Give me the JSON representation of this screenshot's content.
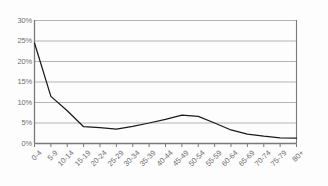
{
  "chart_data": {
    "type": "line",
    "title": "",
    "subtitle": "",
    "xlabel": "",
    "ylabel": "",
    "categories": [
      "0-4",
      "5-9",
      "10-14",
      "15-19",
      "20-24",
      "25-29",
      "30-34",
      "35-39",
      "40-44",
      "45-49",
      "50-54",
      "55-59",
      "60-64",
      "65-69",
      "70-74",
      "75-79",
      "80+"
    ],
    "values": [
      24.5,
      11.5,
      8.0,
      4.1,
      3.9,
      3.5,
      4.2,
      5.0,
      5.9,
      6.9,
      6.6,
      5.0,
      3.3,
      2.3,
      1.8,
      1.4,
      1.3
    ],
    "series": [
      {
        "name": "",
        "values": [
          24.5,
          11.5,
          8.0,
          4.1,
          3.9,
          3.5,
          4.2,
          5.0,
          5.9,
          6.9,
          6.6,
          5.0,
          3.3,
          2.3,
          1.8,
          1.4,
          1.3
        ]
      }
    ],
    "ylim": [
      0,
      30
    ],
    "ytick_values": [
      0,
      5,
      10,
      15,
      20,
      25,
      30
    ],
    "ytick_labels": [
      "0%",
      "5%",
      "10%",
      "15%",
      "20%",
      "25%",
      "30%"
    ],
    "grid": true,
    "grid_axis": "y",
    "legend": false,
    "legend_position": "none",
    "xtick_rotation": -45,
    "colors": {
      "line": "#1a1a1a",
      "grid": "#b4b4b4",
      "axis": "#7a7a7a",
      "tick_text": "#6e6e6e",
      "background": "#fdfdfd"
    }
  }
}
